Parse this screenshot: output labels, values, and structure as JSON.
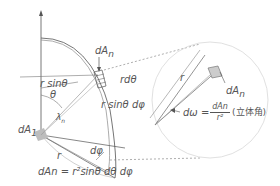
{
  "diagram": {
    "type": "solid-angle-geometry",
    "labels": {
      "dAn_top": "dA",
      "dAn_top_sub": "n",
      "r_dtheta": "rdθ",
      "r_sin_theta": "r sinθ",
      "theta": "θ",
      "r_sin_theta_dphi": "r sinθ dφ",
      "lambda_n": "λ",
      "lambda_n_sub": "n",
      "dA1": "dA",
      "dA1_sub": "1",
      "d_phi": "dφ",
      "r_bottom": "r",
      "formula": "dAn = r²sinθ dθ dφ",
      "r_zoom": "r",
      "dAn_zoom": "dA",
      "dAn_zoom_sub": "n",
      "d_omega": "dω =",
      "frac_num": "dAn",
      "frac_den": "r²",
      "solid_angle_note": "(立体角)"
    },
    "colors": {
      "line": "#555555",
      "light_line": "#bbbbbb",
      "dashed": "#777777",
      "fill": "#bdbdbd"
    }
  }
}
